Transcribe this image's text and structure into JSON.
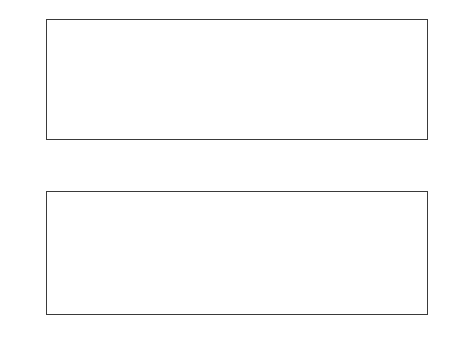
{
  "figure": {
    "width": 457,
    "height": 354,
    "background": "#ffffff",
    "panel_count": 2
  },
  "colors": {
    "noise_gray": "#b9b9b9",
    "smooth_black": "#1a1a1a",
    "dashed_black": "#2b2b2b",
    "axis": "#3a3a3a",
    "text": "#111111"
  },
  "chart_data": [
    {
      "id": "top-panel",
      "type": "line",
      "title": "",
      "xlabel": "",
      "ylabel": "Y",
      "xlim": [
        0,
        500
      ],
      "ylim": [
        -2,
        2
      ],
      "xticks": [
        0,
        50,
        100,
        150,
        200,
        250,
        300,
        350,
        400,
        450,
        500
      ],
      "xticklabels": [
        "0",
        "50",
        "100",
        "150",
        "200",
        "250",
        "300",
        "350",
        "400",
        "450",
        "500"
      ],
      "yticks": [
        -2,
        -1,
        0,
        1,
        2
      ],
      "yticklabels": [
        "-2",
        "-1",
        "0",
        "1",
        "2"
      ],
      "grid": false,
      "legend": false,
      "series": [
        {
          "name": "noisy observations",
          "style": "solid",
          "color": "#b9b9b9",
          "linewidth": 0.6,
          "description": "High-frequency noisy signal spanning roughly -1.7 to +1.8, noise band widening slightly toward larger x",
          "model": {
            "kind": "noisy_damped_oscillation",
            "carrier_amplitude_start": 0.8,
            "carrier_amplitude_end": 0.45,
            "period_start": 26,
            "period_end": 17,
            "trend_start": 0.1,
            "trend_end": -0.35,
            "noise_sigma_start": 0.42,
            "noise_sigma_end": 0.55,
            "n_points": 490
          }
        },
        {
          "name": "smoothed estimate",
          "style": "solid",
          "color": "#1a1a1a",
          "linewidth": 1.4,
          "description": "Smooth oscillation through the noise; peaks decay from about 0.8 near x=0 to about 0.05 near x=470 while troughs fall from about -0.15 to about -0.85",
          "model": {
            "kind": "damped_oscillation",
            "amplitude_start": 0.75,
            "amplitude_end": 0.42,
            "period_start": 26,
            "period_end": 17,
            "trend_start": 0.1,
            "trend_end": -0.38,
            "n_points": 490
          }
        }
      ],
      "peak_envelope_samples": [
        {
          "x": 2,
          "y": 0.82
        },
        {
          "x": 35,
          "y": 0.74
        },
        {
          "x": 58,
          "y": 0.72
        },
        {
          "x": 88,
          "y": 0.64
        },
        {
          "x": 113,
          "y": 0.56
        },
        {
          "x": 143,
          "y": 0.5
        },
        {
          "x": 176,
          "y": 0.5
        },
        {
          "x": 205,
          "y": 0.39
        },
        {
          "x": 238,
          "y": 0.36
        },
        {
          "x": 268,
          "y": 0.28
        },
        {
          "x": 296,
          "y": 0.2
        },
        {
          "x": 330,
          "y": 0.15
        },
        {
          "x": 360,
          "y": 0.11
        },
        {
          "x": 387,
          "y": 0.05
        },
        {
          "x": 415,
          "y": 0.05
        },
        {
          "x": 443,
          "y": 0.0
        },
        {
          "x": 470,
          "y": 0.0
        }
      ],
      "trough_envelope_samples": [
        {
          "x": 18,
          "y": -0.13
        },
        {
          "x": 46,
          "y": -0.1
        },
        {
          "x": 72,
          "y": -0.1
        },
        {
          "x": 100,
          "y": -0.16
        },
        {
          "x": 128,
          "y": -0.2
        },
        {
          "x": 158,
          "y": -0.22
        },
        {
          "x": 190,
          "y": -0.26
        },
        {
          "x": 220,
          "y": -0.33
        },
        {
          "x": 250,
          "y": -0.4
        },
        {
          "x": 282,
          "y": -0.43
        },
        {
          "x": 312,
          "y": -0.5
        },
        {
          "x": 345,
          "y": -0.57
        },
        {
          "x": 374,
          "y": -0.65
        },
        {
          "x": 400,
          "y": -0.72
        },
        {
          "x": 428,
          "y": -0.78
        },
        {
          "x": 456,
          "y": -0.82
        },
        {
          "x": 489,
          "y": -0.9
        }
      ]
    },
    {
      "id": "bottom-panel",
      "type": "line",
      "title": "",
      "xlabel": "2D sorting coordinate",
      "ylabel": "f_1,2",
      "xlim": [
        0,
        500
      ],
      "ylim": [
        -1,
        1
      ],
      "xticks": [
        0,
        50,
        100,
        150,
        200,
        250,
        300,
        350,
        400,
        450,
        500
      ],
      "xticklabels": [
        "0",
        "50",
        "100",
        "150",
        "200",
        "250",
        "300",
        "350",
        "400",
        "450",
        "500"
      ],
      "yticks": [
        -1,
        -0.5,
        0,
        0.5,
        1
      ],
      "yticklabels": [
        "-1",
        "-0.5",
        "0",
        "0.5",
        "1"
      ],
      "grid": false,
      "legend": false,
      "series": [
        {
          "name": "f1 estimate (solid)",
          "style": "solid",
          "color": "#2b2b2b",
          "linewidth": 1.0,
          "description": "Large oscillation; peaks decay from about 0.82 at x=0 toward about -0.05 at x=470, troughs fall from about 0.0 toward about -0.95",
          "model": {
            "kind": "damped_oscillation",
            "amplitude_start": 0.42,
            "amplitude_end": 0.45,
            "period_start": 26,
            "period_end": 17,
            "trend_start": 0.4,
            "trend_end": -0.5,
            "n_points": 490
          }
        },
        {
          "name": "f1 true (dotted overlay)",
          "style": "dotted",
          "color": "#8a8a8a",
          "linewidth": 1.0,
          "description": "Dotted curve nearly coincident with the solid oscillating curve"
        },
        {
          "name": "f2 upper (dashed)",
          "style": "dashed",
          "color": "#2b2b2b",
          "linewidth": 1.0,
          "description": "Small dashed oscillation with amplitude about 0.1 about zero, in antiphase with the lower dashed curve",
          "model": {
            "kind": "small_oscillation",
            "amplitude": 0.1,
            "offset": 0.0,
            "phase": 0,
            "period_start": 26,
            "period_end": 17,
            "n_points": 490
          }
        },
        {
          "name": "f2 lower (dashed)",
          "style": "dashed",
          "color": "#2b2b2b",
          "linewidth": 1.0,
          "description": "Mirror-image small dashed oscillation, amplitude about 0.1 about zero",
          "model": {
            "kind": "small_oscillation",
            "amplitude": 0.1,
            "offset": 0.0,
            "phase": 3.14159,
            "period_start": 26,
            "period_end": 17,
            "n_points": 490
          }
        }
      ],
      "peak_envelope_samples": [
        {
          "x": 2,
          "y": 0.82
        },
        {
          "x": 35,
          "y": 0.79
        },
        {
          "x": 58,
          "y": 0.8
        },
        {
          "x": 88,
          "y": 0.7
        },
        {
          "x": 113,
          "y": 0.67
        },
        {
          "x": 143,
          "y": 0.6
        },
        {
          "x": 176,
          "y": 0.47
        },
        {
          "x": 205,
          "y": 0.41
        },
        {
          "x": 238,
          "y": 0.43
        },
        {
          "x": 268,
          "y": 0.26
        },
        {
          "x": 296,
          "y": 0.28
        },
        {
          "x": 330,
          "y": 0.18
        },
        {
          "x": 360,
          "y": 0.22
        },
        {
          "x": 387,
          "y": 0.1
        },
        {
          "x": 415,
          "y": 0.06
        },
        {
          "x": 443,
          "y": 0.02
        },
        {
          "x": 470,
          "y": -0.02
        }
      ],
      "trough_envelope_samples": [
        {
          "x": 18,
          "y": 0.0
        },
        {
          "x": 46,
          "y": 0.0
        },
        {
          "x": 72,
          "y": -0.02
        },
        {
          "x": 100,
          "y": -0.05
        },
        {
          "x": 128,
          "y": -0.08
        },
        {
          "x": 158,
          "y": -0.18
        },
        {
          "x": 190,
          "y": -0.28
        },
        {
          "x": 220,
          "y": -0.32
        },
        {
          "x": 250,
          "y": -0.4
        },
        {
          "x": 282,
          "y": -0.5
        },
        {
          "x": 312,
          "y": -0.56
        },
        {
          "x": 345,
          "y": -0.57
        },
        {
          "x": 374,
          "y": -0.72
        },
        {
          "x": 400,
          "y": -0.85
        },
        {
          "x": 428,
          "y": -0.8
        },
        {
          "x": 456,
          "y": -0.9
        },
        {
          "x": 489,
          "y": -0.95
        }
      ]
    }
  ]
}
